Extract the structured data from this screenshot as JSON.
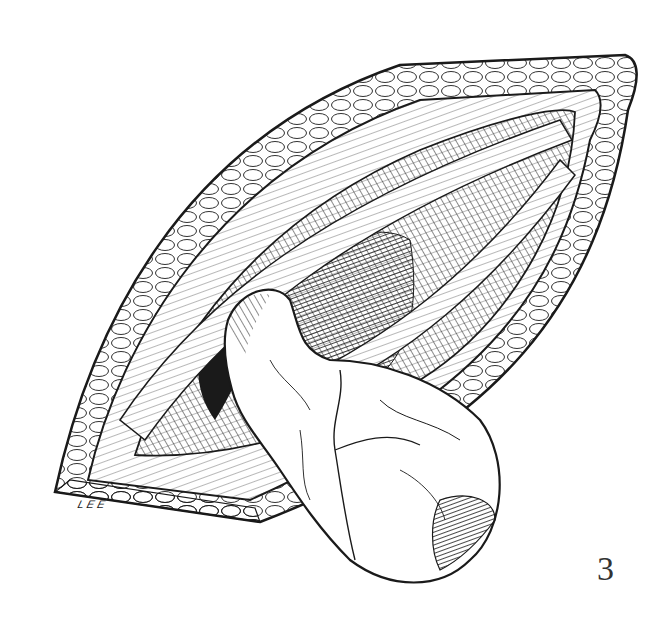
{
  "figure": {
    "number": "3",
    "signature": "LEE",
    "style": "black-and-white pen-and-ink hatching"
  },
  "colors": {
    "ink": "#1a1a1a",
    "paper": "#ffffff",
    "label": "#333333"
  }
}
